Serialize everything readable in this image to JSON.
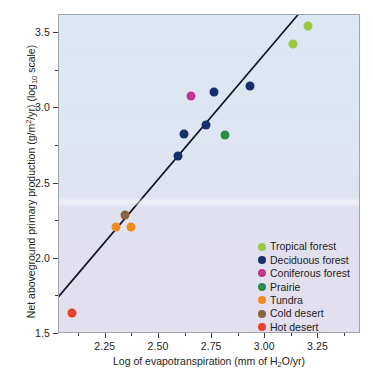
{
  "chart_data": {
    "type": "scatter",
    "title": "",
    "xlabel": "Log of evapotranspiration (mm of H2O/yr)",
    "ylabel": "Net aboveground primary production (g/m2/yr) (log10 scale)",
    "xlim": [
      2.03,
      3.45
    ],
    "ylim": [
      1.5,
      3.62
    ],
    "xticks": [
      "2.25",
      "2.50",
      "2.75",
      "3.00",
      "3.25"
    ],
    "xtick_values": [
      2.25,
      2.5,
      2.75,
      3.0,
      3.25
    ],
    "yticks": [
      "1.5",
      "2.0",
      "2.5",
      "3.0",
      "3.5"
    ],
    "ytick_values": [
      1.5,
      2.0,
      2.5,
      3.0,
      3.5
    ],
    "grid": false,
    "legend_position": "lower-right inside plot",
    "series": [
      {
        "name": "Tropical forest",
        "color": "#9ac93e",
        "points": [
          {
            "x": 3.2,
            "y": 3.55
          },
          {
            "x": 3.13,
            "y": 3.43
          }
        ]
      },
      {
        "name": "Deciduous forest",
        "color": "#16306b",
        "points": [
          {
            "x": 2.93,
            "y": 3.15
          },
          {
            "x": 2.76,
            "y": 3.11
          },
          {
            "x": 2.72,
            "y": 2.89
          },
          {
            "x": 2.62,
            "y": 2.83
          },
          {
            "x": 2.59,
            "y": 2.68
          }
        ]
      },
      {
        "name": "Coniferous forest",
        "color": "#c0378f",
        "points": [
          {
            "x": 2.65,
            "y": 3.08
          }
        ]
      },
      {
        "name": "Prairie",
        "color": "#2f8b4c",
        "points": [
          {
            "x": 2.81,
            "y": 2.82
          }
        ]
      },
      {
        "name": "Tundra",
        "color": "#f28c20",
        "points": [
          {
            "x": 2.3,
            "y": 2.21
          },
          {
            "x": 2.37,
            "y": 2.21
          }
        ]
      },
      {
        "name": "Cold desert",
        "color": "#8a6441",
        "points": [
          {
            "x": 2.34,
            "y": 2.29
          }
        ]
      },
      {
        "name": "Hot desert",
        "color": "#e8422e",
        "points": [
          {
            "x": 2.09,
            "y": 1.64
          }
        ]
      }
    ],
    "trendline": {
      "type": "linear-fit",
      "color": "#11162b",
      "x_start": 2.03,
      "y_start": 1.74,
      "x_end": 3.16,
      "y_end": 3.62
    },
    "annotations": []
  },
  "axes": {
    "x": {
      "title_parts": {
        "before": "Log of evapotranspiration (mm of H",
        "sub": "2",
        "after": "O/yr)"
      },
      "labels": [
        "2.25",
        "2.50",
        "2.75",
        "3.00",
        "3.25"
      ]
    },
    "y": {
      "title_parts": {
        "p1": "Net aboveground primary production (g/m",
        "sup": "2",
        "p2": "/yr) (log",
        "sub": "10",
        "p3": " scale)"
      },
      "labels": [
        "3.5",
        "3.0",
        "2.5",
        "2.0",
        "1.5"
      ]
    }
  },
  "legend": {
    "items": [
      {
        "label": "Tropical forest",
        "color": "#9ac93e"
      },
      {
        "label": "Deciduous forest",
        "color": "#16306b"
      },
      {
        "label": "Coniferous forest",
        "color": "#c0378f"
      },
      {
        "label": "Prairie",
        "color": "#2f8b4c"
      },
      {
        "label": "Tundra",
        "color": "#f28c20"
      },
      {
        "label": "Cold desert",
        "color": "#8a6441"
      },
      {
        "label": "Hot desert",
        "color": "#e8422e"
      }
    ]
  },
  "style": {
    "plot_bg_top": "#d9e8f3",
    "plot_bg_bottom": "#e3dfee",
    "border_color": "#9fa3ad",
    "text_color": "#1d1d22",
    "trendline_color": "#11162b"
  }
}
